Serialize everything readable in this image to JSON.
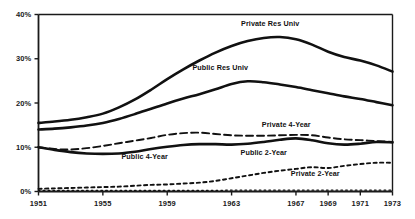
{
  "chart_data": {
    "type": "line",
    "title": "",
    "subtitle": "",
    "xlabel": "",
    "ylabel": "",
    "xlim": [
      1951,
      1973
    ],
    "ylim": [
      0,
      40
    ],
    "grid": false,
    "legend_position": "inline-annotations",
    "y_tick_labels": [
      "40%",
      "30%",
      "20%",
      "10%",
      "0%"
    ],
    "y_tick_values": [
      40,
      30,
      20,
      10,
      0
    ],
    "x_tick_labels": [
      "1951",
      "1955",
      "1959",
      "1963",
      "1967",
      "1969",
      "1971",
      "1973"
    ],
    "x_tick_values": [
      1951,
      1955,
      1959,
      1963,
      1967,
      1969,
      1971,
      1973
    ],
    "x": [
      1951,
      1952,
      1953,
      1954,
      1955,
      1956,
      1957,
      1958,
      1959,
      1960,
      1961,
      1962,
      1963,
      1964,
      1965,
      1966,
      1967,
      1968,
      1969,
      1970,
      1971,
      1972,
      1973
    ],
    "series": [
      {
        "name": "Private Res Univ",
        "style": "solid",
        "width": "thick",
        "color": "#111111",
        "values": [
          15.5,
          15.8,
          16.2,
          16.8,
          17.6,
          19.0,
          20.8,
          23.0,
          25.4,
          27.6,
          29.6,
          31.4,
          32.9,
          34.0,
          34.7,
          34.9,
          34.4,
          33.2,
          31.6,
          30.4,
          29.6,
          28.5,
          27.1
        ]
      },
      {
        "name": "Public Res Univ",
        "style": "solid",
        "width": "thick",
        "color": "#111111",
        "values": [
          14.0,
          14.2,
          14.5,
          14.9,
          15.5,
          16.4,
          17.5,
          18.7,
          19.9,
          21.0,
          22.0,
          23.1,
          24.3,
          24.9,
          24.7,
          24.2,
          23.6,
          22.9,
          22.2,
          21.5,
          20.9,
          20.2,
          19.5
        ]
      },
      {
        "name": "Private 4-Year",
        "style": "dashed",
        "width": "medium",
        "color": "#111111",
        "values": [
          10.0,
          9.6,
          9.5,
          9.8,
          10.3,
          10.9,
          11.5,
          12.1,
          12.8,
          13.2,
          13.3,
          13.0,
          12.7,
          12.6,
          12.6,
          12.7,
          12.8,
          12.7,
          12.2,
          11.8,
          11.6,
          11.4,
          11.2
        ]
      },
      {
        "name": "Public 4-Year",
        "style": "solid",
        "width": "thick",
        "color": "#111111",
        "values": [
          10.0,
          9.4,
          8.9,
          8.6,
          8.5,
          8.6,
          9.0,
          9.6,
          10.1,
          10.5,
          10.7,
          10.7,
          10.6,
          10.8,
          11.2,
          11.7,
          12.0,
          11.6,
          10.9,
          10.6,
          10.8,
          11.2,
          11.1
        ]
      },
      {
        "name": "Public 2-Year",
        "style": "dotted",
        "width": "medium",
        "color": "#111111",
        "values": [
          0.6,
          0.7,
          0.8,
          0.9,
          1.0,
          1.1,
          1.3,
          1.5,
          1.6,
          1.8,
          2.0,
          2.4,
          3.0,
          3.6,
          4.2,
          4.7,
          5.1,
          5.5,
          5.3,
          5.8,
          6.2,
          6.5,
          6.5
        ]
      },
      {
        "name": "Private 2-Year",
        "style": "fine-dotted",
        "width": "thin",
        "color": "#111111",
        "values": [
          0.25,
          0.25,
          0.25,
          0.25,
          0.25,
          0.25,
          0.25,
          0.25,
          0.25,
          0.25,
          0.25,
          0.25,
          0.3,
          0.3,
          0.3,
          0.3,
          0.3,
          0.3,
          0.3,
          0.3,
          0.3,
          0.3,
          0.3
        ]
      }
    ],
    "annotations": [
      {
        "text": "Private Res Univ",
        "x": 1965.4,
        "y": 37.8
      },
      {
        "text": "Public Res Univ",
        "x": 1962.3,
        "y": 28.0
      },
      {
        "text": "Private 4-Year",
        "x": 1966.4,
        "y": 15.0
      },
      {
        "text": "Public 4-Year",
        "x": 1957.6,
        "y": 7.9
      },
      {
        "text": "Public 2-Year",
        "x": 1965.0,
        "y": 8.6
      },
      {
        "text": "Private 2-Year",
        "x": 1968.2,
        "y": 4.0
      }
    ]
  }
}
